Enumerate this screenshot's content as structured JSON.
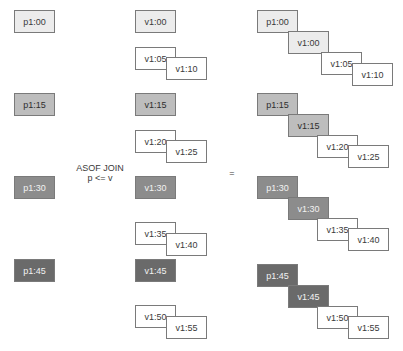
{
  "operator": {
    "line1": "ASOF JOIN",
    "line2": "p <= v",
    "equals": "="
  },
  "left": [
    "p1:00",
    "p1:15",
    "p1:30",
    "p1:45"
  ],
  "right": [
    "v1:00",
    "v1:05",
    "v1:10",
    "v1:15",
    "v1:20",
    "v1:25",
    "v1:30",
    "v1:35",
    "v1:40",
    "v1:45",
    "v1:50",
    "v1:55"
  ],
  "result": [
    {
      "p": "p1:00",
      "v": [
        "v1:00",
        "v1:05",
        "v1:10"
      ]
    },
    {
      "p": "p1:15",
      "v": [
        "v1:15",
        "v1:20",
        "v1:25"
      ]
    },
    {
      "p": "p1:30",
      "v": [
        "v1:30",
        "v1:35",
        "v1:40"
      ]
    },
    {
      "p": "p1:45",
      "v": [
        "v1:45",
        "v1:50",
        "v1:55"
      ]
    }
  ],
  "colors": {
    "group0": "#ececec",
    "group1": "#bdbdbd",
    "group2": "#8c8c8c",
    "group3": "#6a6a6a",
    "unmatched": "#ffffff",
    "border": "#7a7a7a"
  }
}
